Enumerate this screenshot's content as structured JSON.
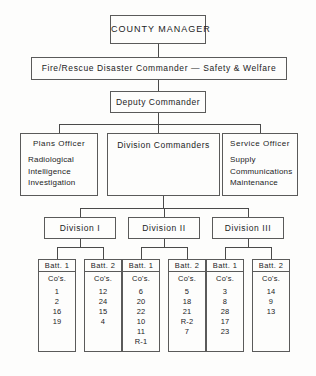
{
  "chart": {
    "type": "org-chart",
    "title_box": {
      "label": "COUNTY  MANAGER"
    },
    "command_box": {
      "label": "Fire/Rescue  Disaster  Commander  —   Safety  &  Welfare"
    },
    "deputy_box": {
      "label": "Deputy  Commander"
    },
    "staff": [
      {
        "key": "plans-officer",
        "title": "Plans  Officer",
        "functions": [
          "Radiological",
          "Intelligence",
          "Investigation"
        ]
      },
      {
        "key": "division-commanders",
        "title": "Division  Commanders",
        "functions": []
      },
      {
        "key": "service-officer",
        "title": "Service  Officer",
        "functions": [
          "Supply",
          "Communications",
          "Maintenance"
        ]
      }
    ],
    "divisions": [
      {
        "key": "division-1",
        "label": "Division  I",
        "battalions": [
          {
            "label": "Batt.  1",
            "units_header": "Co's.",
            "units": [
              "1",
              "2",
              "16",
              "19"
            ]
          },
          {
            "label": "Batt.  2",
            "units_header": "Co's.",
            "units": [
              "12",
              "24",
              "15",
              "4"
            ]
          }
        ]
      },
      {
        "key": "division-2",
        "label": "Division  II",
        "battalions": [
          {
            "label": "Batt.  1",
            "units_header": "Co's.",
            "units": [
              "6",
              "20",
              "22",
              "10",
              "11",
              "R-1"
            ]
          },
          {
            "label": "Batt.  2",
            "units_header": "Co's.",
            "units": [
              "5",
              "18",
              "21",
              "R-2",
              "7"
            ]
          }
        ]
      },
      {
        "key": "division-3",
        "label": "Division  III",
        "battalions": [
          {
            "label": "Batt.  1",
            "units_header": "Co's.",
            "units": [
              "3",
              "8",
              "28",
              "17",
              "23"
            ]
          },
          {
            "label": "Batt.  2",
            "units_header": "Co's.",
            "units": [
              "14",
              "9",
              "13"
            ]
          }
        ]
      }
    ],
    "colors": {
      "background": "#fdfdfc",
      "border": "#5a5a5a",
      "connector": "#4a4a4a",
      "text": "#1c1c1c"
    }
  }
}
